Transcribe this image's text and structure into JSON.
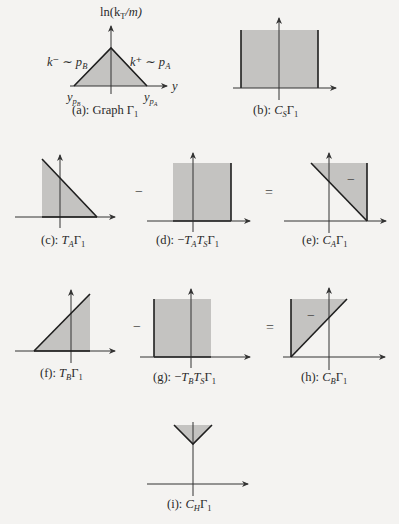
{
  "figure": {
    "panels": [
      {
        "id": "a",
        "caption_prefix": "(a): Graph ",
        "caption_math": "Γ",
        "caption_sub": "1",
        "y_axis_label": "ln(k",
        "y_axis_label_sub": "T",
        "y_axis_label_tail": "/m)",
        "x_axis_label": "y",
        "left_edge_label": "k⁻ ∼ p",
        "left_edge_label_sub": "B",
        "left_edge_label_sup": "−",
        "right_edge_label": "k⁺ ∼ p",
        "right_edge_label_sub": "A",
        "right_edge_label_sup": "+",
        "left_tick_label": "y",
        "left_tick_sub": "p_B",
        "right_tick_label": "y",
        "right_tick_sub": "p_A",
        "shape": "triangle"
      },
      {
        "id": "b",
        "caption_prefix": "(b): ",
        "caption_math": "C",
        "caption_math_sub": "S",
        "caption_tail": "Γ",
        "caption_sub": "1",
        "shape": "rectangle"
      },
      {
        "id": "c",
        "caption_prefix": "(c): ",
        "caption_math": "T",
        "caption_math_sub": "A",
        "caption_tail": "Γ",
        "caption_sub": "1",
        "shape": "right-triangle-descending"
      },
      {
        "id": "d",
        "caption_prefix": "(d): −",
        "caption_math": "T",
        "caption_math_sub": "A",
        "caption_mid": "T",
        "caption_mid_sub": "S",
        "caption_tail": "Γ",
        "caption_sub": "1",
        "shape": "rectangle"
      },
      {
        "id": "e",
        "caption_prefix": "(e): ",
        "caption_math": "C",
        "caption_math_sub": "A",
        "caption_tail": "Γ",
        "caption_sub": "1",
        "region_sign": "−",
        "shape": "triangle-upper-right"
      },
      {
        "id": "f",
        "caption_prefix": "(f): ",
        "caption_math": "T",
        "caption_math_sub": "B",
        "caption_tail": "Γ",
        "caption_sub": "1",
        "shape": "right-triangle-ascending"
      },
      {
        "id": "g",
        "caption_prefix": "(g): −",
        "caption_math": "T",
        "caption_math_sub": "B",
        "caption_mid": "T",
        "caption_mid_sub": "S",
        "caption_tail": "Γ",
        "caption_sub": "1",
        "shape": "rectangle"
      },
      {
        "id": "h",
        "caption_prefix": "(h): ",
        "caption_math": "C",
        "caption_math_sub": "B",
        "caption_tail": "Γ",
        "caption_sub": "1",
        "region_sign": "−",
        "shape": "triangle-upper-left"
      },
      {
        "id": "i",
        "caption_prefix": "(i): ",
        "caption_math": "C",
        "caption_math_sub": "H",
        "caption_tail": "Γ",
        "caption_sub": "1",
        "shape": "inverted-triangle"
      }
    ],
    "operators": {
      "row2_minus": "−",
      "row2_equals": "=",
      "row3_minus": "−",
      "row3_equals": "="
    },
    "colors": {
      "fill": "#c4c3c1",
      "stroke": "#1e1e1e",
      "axis": "#333333",
      "background": "#f4f3f1"
    }
  }
}
